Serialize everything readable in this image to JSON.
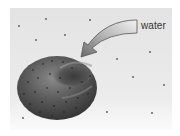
{
  "diagram": {
    "label": "water",
    "arrow": {
      "direction": "into-cell",
      "from": "label",
      "to": "cell-center"
    },
    "colors": {
      "background": "#e6e6e6",
      "cell": "#4a4a4a",
      "arrow_fill": "#b8b8b8",
      "arrow_stroke": "#555555",
      "label_text": "#333333"
    }
  }
}
